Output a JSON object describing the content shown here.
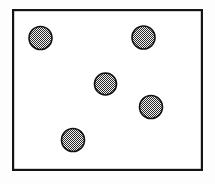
{
  "figure": {
    "title": "",
    "background_color": "#fdfdfd",
    "frame": {
      "name": "bounding-rectangle",
      "x": 12,
      "y": 9,
      "width": 191,
      "height": 162,
      "stroke_color": "#141414",
      "stroke_width": 2.2,
      "fill_color": "#ffffff"
    },
    "circle_style": {
      "stroke_color": "#111111",
      "stroke_width": 1.6,
      "fill_pattern": "stipple-halftone",
      "pattern_dot_color": "#2b2b2b",
      "pattern_background": "#f2f2f2"
    },
    "circles": [
      {
        "label": "circle-top-left",
        "cx": 40.5,
        "cy": 38.0,
        "r": 11.5
      },
      {
        "label": "circle-top-right",
        "cx": 143.5,
        "cy": 37.5,
        "r": 11.5
      },
      {
        "label": "circle-center",
        "cx": 105.5,
        "cy": 84.0,
        "r": 11.0
      },
      {
        "label": "circle-right-middle",
        "cx": 151.0,
        "cy": 107.0,
        "r": 11.5
      },
      {
        "label": "circle-bottom-left",
        "cx": 73.0,
        "cy": 140.0,
        "r": 11.5
      }
    ]
  }
}
